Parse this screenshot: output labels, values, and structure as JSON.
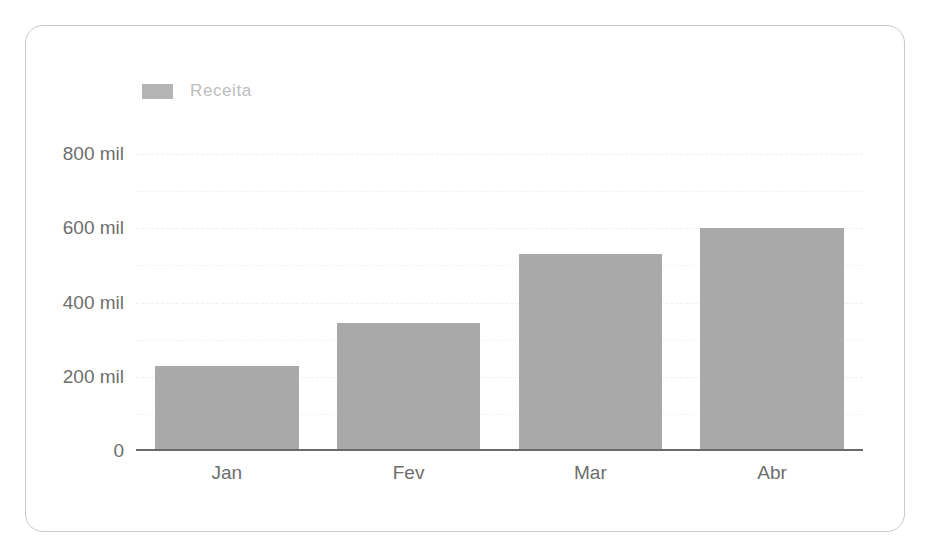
{
  "card": {
    "background": "#ffffff",
    "border_color": "#c9c9c9"
  },
  "legend": {
    "position": "top-left",
    "entries": [
      {
        "label": "Receita",
        "color": "#b5b5b5"
      }
    ]
  },
  "colors": {
    "bar_fill": "#a9a9a9",
    "axis_line": "#6a6a6a",
    "tick_text": "#6e6e6e",
    "legend_text": "#bdbdbd",
    "gridline": "#efefef"
  },
  "chart_data": {
    "type": "bar",
    "title": "",
    "subtitle": "",
    "xlabel": "",
    "ylabel": "",
    "categories": [
      "Jan",
      "Fev",
      "Mar",
      "Abr"
    ],
    "series": [
      {
        "name": "Receita",
        "values": [
          230000,
          345000,
          530000,
          600000
        ]
      }
    ],
    "values": [
      230000,
      345000,
      530000,
      600000
    ],
    "ylim": [
      0,
      800000
    ],
    "ytick_values": [
      0,
      200000,
      400000,
      600000,
      800000
    ],
    "ytick_labels": [
      "0",
      "200 mil",
      "400 mil",
      "600 mil",
      "800 mil"
    ],
    "gridline_values": [
      100000,
      200000,
      300000,
      400000,
      500000,
      600000,
      700000,
      800000
    ],
    "grid": true,
    "grid_style": "dashed",
    "legend": [
      "Receita"
    ],
    "legend_position": "top-left",
    "annotations": []
  }
}
